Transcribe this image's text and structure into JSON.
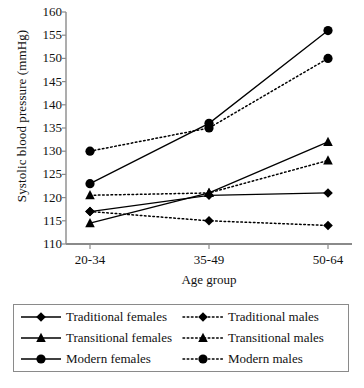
{
  "chart_data": {
    "type": "line",
    "title": "",
    "xlabel": "Age group",
    "ylabel": "Systolic blood pressure (mmHg)",
    "categories": [
      "20-34",
      "35-49",
      "50-64"
    ],
    "ylim": [
      110,
      160
    ],
    "ytick_step": 5,
    "yticks": [
      110,
      115,
      120,
      125,
      130,
      135,
      140,
      145,
      150,
      155,
      160
    ],
    "grid": false,
    "legend_position": "bottom",
    "series": [
      {
        "name": "Traditional females",
        "values": [
          117,
          120.5,
          121
        ],
        "marker": "diamond",
        "line": "solid",
        "color": "#000000"
      },
      {
        "name": "Traditional males",
        "values": [
          117,
          115,
          114
        ],
        "marker": "diamond",
        "line": "dotted",
        "color": "#000000"
      },
      {
        "name": "Transitional females",
        "values": [
          114.5,
          121,
          132
        ],
        "marker": "triangle",
        "line": "solid",
        "color": "#000000"
      },
      {
        "name": "Transitional males",
        "values": [
          120.5,
          121,
          128
        ],
        "marker": "triangle",
        "line": "dotted",
        "color": "#000000"
      },
      {
        "name": "Modern females",
        "values": [
          123,
          136,
          156
        ],
        "marker": "circle",
        "line": "solid",
        "color": "#000000"
      },
      {
        "name": "Modern males",
        "values": [
          130,
          135,
          150
        ],
        "marker": "circle",
        "line": "dotted",
        "color": "#000000"
      }
    ]
  },
  "legend": {
    "entries": [
      {
        "label": "Traditional females",
        "marker": "diamond",
        "line": "solid"
      },
      {
        "label": "Traditional males",
        "marker": "diamond",
        "line": "dotted"
      },
      {
        "label": "Transitional females",
        "marker": "triangle",
        "line": "solid"
      },
      {
        "label": "Transitional males",
        "marker": "triangle",
        "line": "dotted"
      },
      {
        "label": "Modern females",
        "marker": "circle",
        "line": "solid"
      },
      {
        "label": "Modern males",
        "marker": "circle",
        "line": "dotted"
      }
    ]
  },
  "axis": {
    "line_color": "#8a8a8a"
  }
}
